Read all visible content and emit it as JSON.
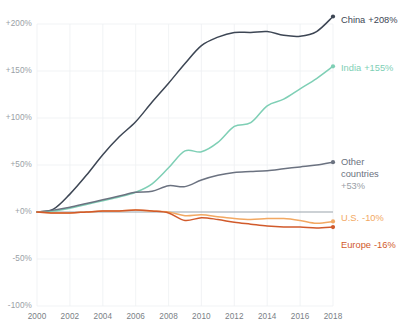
{
  "chart_data": {
    "type": "line",
    "title": "",
    "subtitle": "",
    "xlabel": "",
    "ylabel": "",
    "xlim": [
      2000,
      2018
    ],
    "ylim": [
      -100,
      200
    ],
    "grid": true,
    "legend_position": "right-inline-labels",
    "x_tick_labels": [
      "2000",
      "2002",
      "2004",
      "2006",
      "2008",
      "2010",
      "2012",
      "2014",
      "2016",
      "2018"
    ],
    "x_ticks": [
      2000,
      2002,
      2004,
      2006,
      2008,
      2010,
      2012,
      2014,
      2016,
      2018
    ],
    "y_tick_labels": [
      "+200%",
      "+150%",
      "+100%",
      "+50%",
      "+0%",
      "-50%",
      "-100%"
    ],
    "y_ticks": [
      200,
      150,
      100,
      50,
      0,
      -50,
      -100
    ],
    "x": [
      2000,
      2001,
      2002,
      2003,
      2004,
      2005,
      2006,
      2007,
      2008,
      2009,
      2010,
      2011,
      2012,
      2013,
      2014,
      2015,
      2016,
      2017,
      2018
    ],
    "series": [
      {
        "name": "China",
        "label": "China +208%",
        "end_value_label": "+208%",
        "color": "#3d4654",
        "values": [
          0,
          3,
          19,
          39,
          61,
          80,
          96,
          117,
          137,
          158,
          177,
          186,
          191,
          191,
          192,
          188,
          187,
          192,
          208
        ]
      },
      {
        "name": "India",
        "label": "India +155%",
        "end_value_label": "+155%",
        "color": "#7ecfb5",
        "values": [
          0,
          1,
          4,
          8,
          12,
          16,
          21,
          30,
          47,
          65,
          64,
          74,
          91,
          95,
          113,
          120,
          131,
          142,
          155
        ]
      },
      {
        "name": "Other countries",
        "label": "Other countries +53%",
        "end_value_label": "+53%",
        "color": "#6b7280",
        "values": [
          0,
          2,
          5,
          9,
          13,
          17,
          21,
          22,
          28,
          27,
          34,
          39,
          42,
          43,
          44,
          46,
          48,
          50,
          53
        ]
      },
      {
        "name": "U.S.",
        "label": "U.S. -10%",
        "end_value_label": "-10%",
        "color": "#f2a862",
        "values": [
          0,
          -1,
          -1,
          0,
          1,
          1,
          2,
          1,
          0,
          -4,
          -3,
          -5,
          -7,
          -8,
          -7,
          -7,
          -9,
          -12,
          -10
        ]
      },
      {
        "name": "Europe",
        "label": "Europe -16%",
        "end_value_label": "-16%",
        "color": "#d15a2b",
        "values": [
          0,
          -1,
          -1,
          0,
          1,
          1,
          2,
          1,
          -1,
          -9,
          -6,
          -8,
          -11,
          -13,
          -15,
          -16,
          -16,
          -17,
          -16
        ]
      }
    ],
    "annotations": [
      {
        "id": "china",
        "text_name": "China",
        "text_value": "+208%",
        "x": 2018,
        "y": 208
      },
      {
        "id": "india",
        "text_name": "India",
        "text_value": "+155%",
        "x": 2018,
        "y": 155
      },
      {
        "id": "other",
        "text_name": "Other countries",
        "text_value": "+53%",
        "x": 2018,
        "y": 53
      },
      {
        "id": "us",
        "text_name": "U.S.",
        "text_value": "-10%",
        "x": 2018,
        "y": -10
      },
      {
        "id": "europe",
        "text_name": "Europe",
        "text_value": "-16%",
        "x": 2018,
        "y": -16
      }
    ]
  },
  "labels": {
    "china_name": "China",
    "china_value": "+208%",
    "india_name": "India",
    "india_value": "+155%",
    "other_name_line1": "Other",
    "other_name_line2": "countries",
    "other_value": "+53%",
    "us_name": "U.S.",
    "us_value": "-10%",
    "europe_name": "Europe",
    "europe_value": "-16%"
  },
  "yticks": {
    "t200": "+200%",
    "t150": "+150%",
    "t100": "+100%",
    "t50": "+50%",
    "t0": "+0%",
    "tm50": "-50%",
    "tm100": "-100%"
  },
  "xticks": {
    "y2000": "2000",
    "y2002": "2002",
    "y2004": "2004",
    "y2006": "2006",
    "y2008": "2008",
    "y2010": "2010",
    "y2012": "2012",
    "y2014": "2014",
    "y2016": "2016",
    "y2018": "2018"
  }
}
